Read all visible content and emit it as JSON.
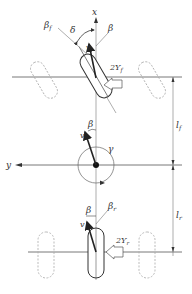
{
  "diagram": {
    "type": "bicycle vehicle model (top view)",
    "labels": {
      "x_axis": "x",
      "y_axis": "y",
      "delta": "δ",
      "beta_front_slip": "βf",
      "beta_front_sub": "f",
      "beta_front_base": "β",
      "beta_vehicle_top": "β",
      "velocity_front": "v",
      "front_force": "2Yf",
      "front_force_base": "2Y",
      "front_force_sub": "f",
      "lf": "lf",
      "lf_base": "l",
      "lf_sub": "f",
      "velocity_cg": "v",
      "beta_cg": "β",
      "gamma": "γ",
      "lr": "lr",
      "lr_base": "l",
      "lr_sub": "r",
      "beta_rear": "β",
      "beta_rear_slip_base": "β",
      "beta_rear_slip_sub": "r",
      "velocity_rear": "v",
      "rear_force_base": "2Y",
      "rear_force_sub": "r"
    },
    "colors": {
      "line": "#555555",
      "dashed": "#aaaaaa",
      "arrow": "#222222",
      "text": "#333333"
    }
  }
}
